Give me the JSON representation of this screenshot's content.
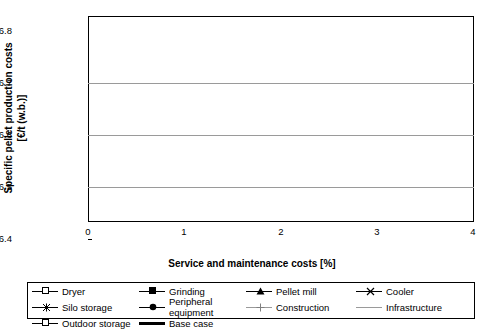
{
  "chart_data": {
    "type": "line",
    "title": "",
    "xlabel": "Service and maintenance costs [%]",
    "ylabel_line1": "Specific pellet production costs",
    "ylabel_line2": "[€/t (w.b.)]",
    "xlim": [
      0,
      4
    ],
    "ylim": [
      136.4,
      136.8
    ],
    "xticks": [
      "0",
      "1",
      "2",
      "3",
      "4"
    ],
    "yticks": [
      "136.4",
      "136.5",
      "136.6",
      "136.7",
      "136.8"
    ],
    "grid": "horizontal",
    "legend_position": "below-plot",
    "base_case_value": 136.588,
    "series": [
      {
        "name": "Dryer",
        "marker": "open-square",
        "color": "#000000",
        "points": [
          [
            0.8,
            136.583
          ],
          [
            1.0,
            136.588
          ],
          [
            1.2,
            136.594
          ]
        ]
      },
      {
        "name": "Grinding",
        "marker": "filled-square",
        "color": "#000000",
        "points": [
          [
            2.1,
            136.575
          ],
          [
            2.4,
            136.588
          ],
          [
            2.7,
            136.601
          ],
          [
            2.9,
            136.611
          ]
        ]
      },
      {
        "name": "Pellet mill",
        "marker": "filled-triangle",
        "color": "#000000",
        "points": [
          [
            2.1,
            136.56
          ],
          [
            2.4,
            136.588
          ],
          [
            2.7,
            136.613
          ],
          [
            2.9,
            136.642
          ]
        ]
      },
      {
        "name": "Cooler",
        "marker": "cross-x",
        "color": "#000000",
        "points": [
          [
            1.85,
            136.512
          ],
          [
            2.1,
            136.552
          ],
          [
            2.4,
            136.588
          ],
          [
            2.65,
            136.625
          ],
          [
            2.9,
            136.67
          ]
        ]
      },
      {
        "name": "Silo storage",
        "marker": "star-x",
        "color": "#000000",
        "points": [
          [
            1.9,
            136.561
          ],
          [
            2.15,
            136.573
          ],
          [
            2.4,
            136.588
          ],
          [
            2.65,
            136.6
          ],
          [
            2.9,
            136.612
          ]
        ]
      },
      {
        "name": "Peripheral equipment",
        "marker": "filled-circle",
        "color": "#000000",
        "points": [
          [
            1.95,
            136.574
          ],
          [
            2.2,
            136.581
          ],
          [
            2.4,
            136.588
          ],
          [
            2.65,
            136.595
          ],
          [
            2.9,
            136.602
          ]
        ]
      },
      {
        "name": "Construction",
        "marker": "plus",
        "color": "#7f7f7f",
        "points": [
          [
            1.85,
            136.528
          ],
          [
            2.15,
            136.558
          ],
          [
            2.4,
            136.588
          ],
          [
            2.65,
            136.616
          ],
          [
            2.9,
            136.647
          ]
        ]
      },
      {
        "name": "Infrastructure",
        "marker": "none",
        "color": "#9a9a9a",
        "points": [
          [
            1.9,
            136.585
          ],
          [
            2.4,
            136.588
          ],
          [
            2.9,
            136.592
          ]
        ]
      },
      {
        "name": "Outdoor storage",
        "marker": "open-square-small",
        "color": "#000000",
        "points": [
          [
            1.55,
            136.522
          ],
          [
            1.85,
            136.527
          ],
          [
            2.2,
            136.56
          ],
          [
            2.4,
            136.588
          ],
          [
            2.65,
            136.65
          ],
          [
            2.9,
            136.701
          ]
        ]
      },
      {
        "name": "Base case",
        "marker": "none",
        "color": "#000000",
        "thick": true,
        "points": [
          [
            0.05,
            136.588
          ],
          [
            3.95,
            136.588
          ]
        ]
      }
    ]
  },
  "legend": {
    "row1": [
      "Dryer",
      "Grinding",
      "Pellet mill",
      "Cooler"
    ],
    "row2": [
      "Silo storage",
      "Peripheral equipment",
      "Construction",
      "Infrastructure"
    ],
    "row3": [
      "Outdoor storage",
      "Base case"
    ]
  }
}
